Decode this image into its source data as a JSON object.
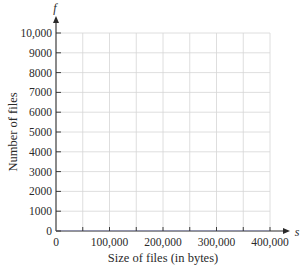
{
  "chart_data": {
    "type": "line",
    "title": "",
    "xlabel": "Size of files (in bytes)",
    "ylabel": "Number of files",
    "x_axis_variable": "s",
    "y_axis_variable": "f",
    "xlim": [
      0,
      400000
    ],
    "ylim": [
      0,
      10000
    ],
    "x_ticks": [
      0,
      100000,
      200000,
      300000,
      400000
    ],
    "x_tick_labels": [
      "0",
      "100,000",
      "200,000",
      "300,000",
      "400,000"
    ],
    "x_minor_gridlines_every": 50000,
    "y_ticks": [
      0,
      1000,
      2000,
      3000,
      4000,
      5000,
      6000,
      7000,
      8000,
      9000,
      10000
    ],
    "y_tick_labels": [
      "0",
      "1000",
      "2000",
      "3000",
      "4000",
      "5000",
      "6000",
      "7000",
      "8000",
      "9000",
      "10,000"
    ],
    "grid": true,
    "legend": null,
    "series": []
  },
  "colors": {
    "axis": "#2a2a2a",
    "grid": "#d6d6d6",
    "baseline_tint": "#8a8fc0"
  }
}
